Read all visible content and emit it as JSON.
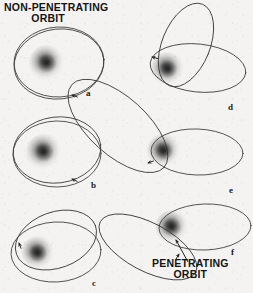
{
  "figure": {
    "background_color": "#f4f3f1",
    "ink_color": "#3a3a3a",
    "text_color": "#141414",
    "width": 253,
    "height": 293
  },
  "titles": {
    "top": {
      "line1": "NON-PENETRATING",
      "line2": "ORBIT"
    },
    "bottom": {
      "line1": "PENETRATING",
      "line2": "ORBIT"
    }
  },
  "panels": [
    {
      "id": "a",
      "label": "a",
      "label_x": 86,
      "label_y": 88,
      "caption_ref": "non-penetrating circular orbit",
      "nucleus": {
        "cx": 47,
        "cy": 63,
        "r": 18
      },
      "orbits": [
        {
          "cx": 59,
          "cy": 62,
          "rx": 45,
          "ry": 35,
          "rot": -3
        },
        {
          "cx": 59,
          "cy": 64,
          "rx": 45,
          "ry": 35,
          "rot": -6
        }
      ],
      "arrows": [
        {
          "x": 72,
          "y": 95,
          "angle": 200
        }
      ]
    },
    {
      "id": "b",
      "label": "b",
      "label_x": 91,
      "label_y": 180,
      "caption_ref": "non-penetrating precessing orbit",
      "nucleus": {
        "cx": 44,
        "cy": 152,
        "r": 18
      },
      "orbits": [
        {
          "cx": 57,
          "cy": 150,
          "rx": 44,
          "ry": 33,
          "rot": -7
        },
        {
          "cx": 57,
          "cy": 154,
          "rx": 44,
          "ry": 33,
          "rot": -1
        }
      ],
      "arrows": [
        {
          "x": 72,
          "y": 179,
          "angle": 205
        }
      ]
    },
    {
      "id": "c",
      "label": "c",
      "label_x": 92,
      "label_y": 278,
      "caption_ref": "non-penetrating strongly precessing orbit",
      "nucleus": {
        "cx": 38,
        "cy": 253,
        "r": 17
      },
      "orbits": [
        {
          "cx": 56,
          "cy": 240,
          "rx": 42,
          "ry": 28,
          "rot": -20
        },
        {
          "cx": 56,
          "cy": 252,
          "rx": 45,
          "ry": 30,
          "rot": -3
        }
      ],
      "arrows": [
        {
          "x": 19,
          "y": 243,
          "angle": 250
        }
      ]
    },
    {
      "id": "d",
      "label": "d",
      "label_x": 228,
      "label_y": 102,
      "caption_ref": "penetrating orbit, steep precession",
      "nucleus": {
        "cx": 168,
        "cy": 69,
        "r": 17
      },
      "orbits": [
        {
          "cx": 186,
          "cy": 45,
          "rx": 24,
          "ry": 44,
          "rot": 22
        },
        {
          "cx": 198,
          "cy": 68,
          "rx": 48,
          "ry": 24,
          "rot": 6
        }
      ],
      "arrows": [
        {
          "x": 152,
          "y": 57,
          "angle": 195
        }
      ]
    },
    {
      "id": "e",
      "label": "e",
      "label_x": 229,
      "label_y": 185,
      "caption_ref": "penetrating orbit, elongated outer loop",
      "nucleus": {
        "cx": 164,
        "cy": 151,
        "r": 17
      },
      "orbits": [
        {
          "cx": 197,
          "cy": 152,
          "rx": 46,
          "ry": 23,
          "rot": 2
        },
        {
          "cx": 118,
          "cy": 126,
          "rx": 62,
          "ry": 29,
          "rot": 42
        }
      ],
      "arrows": [
        {
          "x": 148,
          "y": 163,
          "angle": 160
        }
      ]
    },
    {
      "id": "f",
      "label": "f",
      "label_x": 231,
      "label_y": 247,
      "caption_ref": "penetrating orbit",
      "nucleus": {
        "cx": 172,
        "cy": 227,
        "r": 17
      },
      "orbits": [
        {
          "cx": 205,
          "cy": 227,
          "rx": 46,
          "ry": 23,
          "rot": -2
        },
        {
          "cx": 148,
          "cy": 247,
          "rx": 54,
          "ry": 24,
          "rot": 28
        }
      ],
      "arrows": [
        {
          "x": 179,
          "y": 254,
          "angle": 300
        }
      ]
    }
  ],
  "annotations": [
    {
      "name": "penetrating-orbit-pointer",
      "from_x": 188,
      "from_y": 262,
      "to_x": 176,
      "to_y": 240
    }
  ]
}
